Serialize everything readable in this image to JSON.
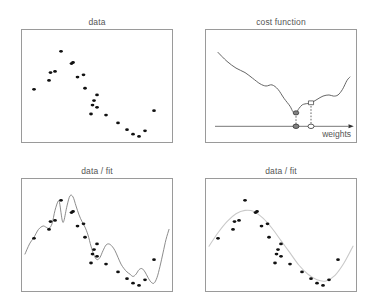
{
  "figure": {
    "background": "#ffffff",
    "panel_border_color": "#9a9a9a",
    "title_color": "#555555",
    "point_color": "#111111",
    "curve_color_dark": "#555555",
    "curve_color_light": "#c9c9c9",
    "marker_fill_color": "#808080",
    "marker_edge_color": "#333333"
  },
  "panels": {
    "data": {
      "title": "data",
      "chart_type": "scatter"
    },
    "cost": {
      "title": "cost function",
      "chart_type": "line",
      "axis_label": "weights"
    },
    "fit_wiggly": {
      "title": "data / fit",
      "chart_type": "scatter"
    },
    "fit_smooth": {
      "title": "data / fit",
      "chart_type": "scatter"
    }
  },
  "chart_data": [
    {
      "id": "data",
      "type": "scatter",
      "title": "data",
      "xlabel": "",
      "ylabel": "",
      "xlim": [
        0,
        100
      ],
      "ylim": [
        0,
        100
      ],
      "grid": false,
      "legend": null,
      "marker": "filled-circle",
      "points": [
        [
          8,
          47
        ],
        [
          19,
          62
        ],
        [
          18,
          55
        ],
        [
          22,
          63
        ],
        [
          26,
          81
        ],
        [
          33,
          70
        ],
        [
          34,
          71
        ],
        [
          37,
          58
        ],
        [
          41,
          60
        ],
        [
          42,
          48
        ],
        [
          48,
          37
        ],
        [
          50,
          42
        ],
        [
          50,
          31
        ],
        [
          46,
          25
        ],
        [
          47,
          33
        ],
        [
          56,
          24
        ],
        [
          64,
          17
        ],
        [
          70,
          11
        ],
        [
          74,
          7
        ],
        [
          78,
          5
        ],
        [
          82,
          10
        ],
        [
          88,
          28
        ]
      ]
    },
    {
      "id": "cost",
      "type": "line",
      "title": "cost function",
      "xlabel": "weights",
      "ylabel": "",
      "xlim": [
        0,
        100
      ],
      "ylim": [
        0,
        100
      ],
      "grid": false,
      "legend": null,
      "series": [
        {
          "name": "cost",
          "points": [
            [
              8,
              80
            ],
            [
              14,
              72
            ],
            [
              20,
              66
            ],
            [
              26,
              62
            ],
            [
              31,
              57
            ],
            [
              36,
              52
            ],
            [
              40,
              50
            ],
            [
              44,
              51
            ],
            [
              48,
              47
            ],
            [
              52,
              39
            ],
            [
              56,
              32
            ],
            [
              58,
              27
            ],
            [
              60,
              26
            ],
            [
              62,
              30
            ],
            [
              64,
              33
            ],
            [
              66,
              34
            ],
            [
              70,
              35
            ],
            [
              74,
              38
            ],
            [
              78,
              41
            ],
            [
              82,
              42
            ],
            [
              85,
              41
            ],
            [
              88,
              42
            ],
            [
              91,
              47
            ],
            [
              94,
              55
            ],
            [
              96,
              58
            ]
          ]
        }
      ],
      "annotations": {
        "global_min_marker": {
          "x": 60,
          "y": 26,
          "style": "filled-circle",
          "label": ""
        },
        "local_point_marker": {
          "x": 70,
          "y": 35,
          "style": "open-square",
          "label": ""
        },
        "axis_markers": [
          {
            "x": 60,
            "style": "filled-circle"
          },
          {
            "x": 70,
            "style": "open-circle"
          }
        ],
        "dropline_style": "dotted",
        "axis_arrow": "right"
      }
    },
    {
      "id": "fit_wiggly",
      "type": "scatter",
      "title": "data / fit",
      "xlabel": "",
      "ylabel": "",
      "xlim": [
        0,
        100
      ],
      "ylim": [
        0,
        100
      ],
      "grid": false,
      "legend": null,
      "fit_description": "overfit high-order wiggly curve passing near every point",
      "points": [
        [
          8,
          47
        ],
        [
          19,
          62
        ],
        [
          18,
          55
        ],
        [
          22,
          63
        ],
        [
          26,
          81
        ],
        [
          33,
          70
        ],
        [
          34,
          71
        ],
        [
          37,
          58
        ],
        [
          41,
          60
        ],
        [
          42,
          48
        ],
        [
          48,
          37
        ],
        [
          50,
          42
        ],
        [
          50,
          31
        ],
        [
          46,
          25
        ],
        [
          47,
          33
        ],
        [
          56,
          24
        ],
        [
          64,
          17
        ],
        [
          70,
          11
        ],
        [
          74,
          7
        ],
        [
          78,
          5
        ],
        [
          82,
          10
        ],
        [
          88,
          28
        ]
      ],
      "fit_curve": [
        [
          2,
          33
        ],
        [
          5,
          42
        ],
        [
          8,
          48
        ],
        [
          11,
          55
        ],
        [
          14,
          58
        ],
        [
          16,
          57
        ],
        [
          18,
          56
        ],
        [
          20,
          60
        ],
        [
          22,
          72
        ],
        [
          24,
          80
        ],
        [
          25,
          79
        ],
        [
          26,
          70
        ],
        [
          27,
          62
        ],
        [
          28,
          63
        ],
        [
          30,
          76
        ],
        [
          32,
          85
        ],
        [
          34,
          84
        ],
        [
          36,
          76
        ],
        [
          38,
          68
        ],
        [
          40,
          62
        ],
        [
          42,
          57
        ],
        [
          44,
          50
        ],
        [
          46,
          40
        ],
        [
          48,
          32
        ],
        [
          50,
          28
        ],
        [
          52,
          30
        ],
        [
          54,
          36
        ],
        [
          56,
          41
        ],
        [
          58,
          42
        ],
        [
          60,
          40
        ],
        [
          62,
          36
        ],
        [
          64,
          30
        ],
        [
          66,
          24
        ],
        [
          68,
          20
        ],
        [
          70,
          17
        ],
        [
          72,
          15
        ],
        [
          74,
          13
        ],
        [
          76,
          15
        ],
        [
          78,
          19
        ],
        [
          80,
          20
        ],
        [
          82,
          17
        ],
        [
          84,
          12
        ],
        [
          86,
          8
        ],
        [
          88,
          7
        ],
        [
          90,
          12
        ],
        [
          92,
          22
        ],
        [
          94,
          34
        ],
        [
          96,
          46
        ],
        [
          98,
          55
        ]
      ]
    },
    {
      "id": "fit_smooth",
      "type": "scatter",
      "title": "data / fit",
      "xlabel": "",
      "ylabel": "",
      "xlim": [
        0,
        100
      ],
      "ylim": [
        0,
        100
      ],
      "grid": false,
      "legend": null,
      "fit_description": "smooth sinusoidal regression curve",
      "points": [
        [
          8,
          47
        ],
        [
          19,
          62
        ],
        [
          18,
          55
        ],
        [
          22,
          63
        ],
        [
          26,
          81
        ],
        [
          33,
          70
        ],
        [
          34,
          71
        ],
        [
          37,
          58
        ],
        [
          41,
          60
        ],
        [
          42,
          48
        ],
        [
          48,
          37
        ],
        [
          50,
          42
        ],
        [
          50,
          31
        ],
        [
          46,
          25
        ],
        [
          47,
          33
        ],
        [
          56,
          24
        ],
        [
          64,
          17
        ],
        [
          70,
          11
        ],
        [
          74,
          7
        ],
        [
          78,
          5
        ],
        [
          82,
          10
        ],
        [
          88,
          28
        ]
      ],
      "fit_curve": [
        [
          2,
          40
        ],
        [
          8,
          52
        ],
        [
          14,
          62
        ],
        [
          20,
          69
        ],
        [
          26,
          72
        ],
        [
          32,
          71
        ],
        [
          38,
          65
        ],
        [
          44,
          56
        ],
        [
          50,
          45
        ],
        [
          56,
          34
        ],
        [
          62,
          23
        ],
        [
          68,
          15
        ],
        [
          74,
          10
        ],
        [
          80,
          9
        ],
        [
          86,
          14
        ],
        [
          92,
          25
        ],
        [
          98,
          40
        ]
      ]
    }
  ]
}
